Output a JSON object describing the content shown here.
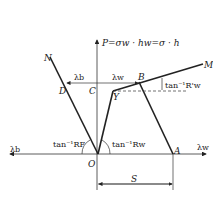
{
  "diagram": {
    "axis_vertical_label": "P=σw · hw=σ · h",
    "axis_left_label": "λb",
    "axis_right_label": "λw",
    "points": {
      "N": "N",
      "D": "D",
      "C": "C",
      "B": "B",
      "M": "M",
      "Y": "Y",
      "O": "O",
      "A": "A"
    },
    "dim_lambda_b": "λb",
    "dim_lambda_w": "λw",
    "angle_RF": "tan⁻¹RF",
    "angle_Rw": "tan⁻¹Rw",
    "angle_Rw_prime": "tan⁻¹R'w",
    "dim_S": "S"
  }
}
